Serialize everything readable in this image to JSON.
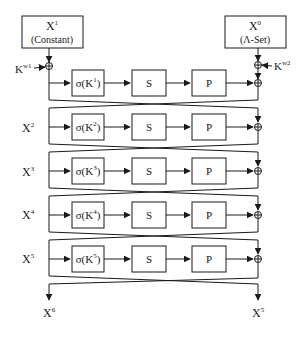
{
  "top": {
    "left_box": {
      "title": "X",
      "sup": "1",
      "subtitle": "(Constant)"
    },
    "right_box": {
      "title": "X",
      "sup": "0",
      "subtitle": "(Λ-Set)"
    },
    "left_key": {
      "label": "K",
      "sup": "w1"
    },
    "right_key": {
      "label": "K",
      "sup": "w2"
    }
  },
  "rounds": [
    {
      "side_label": "",
      "sup": "",
      "sigma": "σ(K",
      "sigma_sup": "1",
      "s": "S",
      "p": "P"
    },
    {
      "side_label": "X",
      "sup": "2",
      "sigma": "σ(K",
      "sigma_sup": "2",
      "s": "S",
      "p": "P"
    },
    {
      "side_label": "X",
      "sup": "3",
      "sigma": "σ(K",
      "sigma_sup": "3",
      "s": "S",
      "p": "P"
    },
    {
      "side_label": "X",
      "sup": "4",
      "sigma": "σ(K",
      "sigma_sup": "4",
      "s": "S",
      "p": "P"
    },
    {
      "side_label": "X",
      "sup": "5",
      "sigma": "σ(K",
      "sigma_sup": "5",
      "s": "S",
      "p": "P"
    }
  ],
  "outputs": {
    "left": {
      "label": "X",
      "sup": "6"
    },
    "right": {
      "label": "X",
      "sup": "5"
    }
  },
  "colors": {
    "line": "#1a1a1a",
    "background": "#ffffff"
  }
}
